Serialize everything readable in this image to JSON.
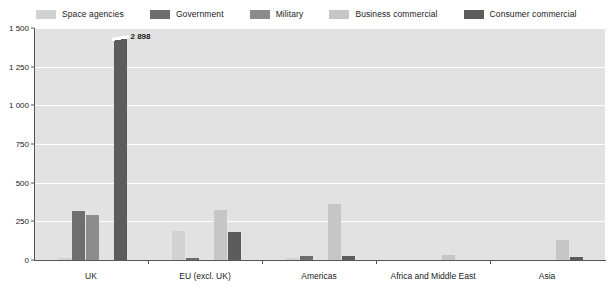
{
  "legend": {
    "position": "top",
    "items": [
      {
        "label": "Space agencies",
        "color": "#d2d2d2"
      },
      {
        "label": "Government",
        "color": "#6e6e6e"
      },
      {
        "label": "Military",
        "color": "#8c8c8c"
      },
      {
        "label": "Business commercial",
        "color": "#c6c6c6"
      },
      {
        "label": "Consumer commercial",
        "color": "#5c5c5c"
      }
    ]
  },
  "yaxis": {
    "ticks": [
      "1 500",
      "1 250",
      "1 000",
      "750",
      "500",
      "250",
      "0"
    ]
  },
  "annotations": {
    "uk_consumer_value_label": "2 898"
  },
  "chart_data": {
    "type": "bar",
    "title": "",
    "subtitle": "",
    "xlabel": "",
    "ylabel": "",
    "ylim": [
      0,
      1500
    ],
    "ytick_values": [
      0,
      250,
      500,
      750,
      1000,
      1250,
      1500
    ],
    "ytick_labels": [
      "0",
      "250",
      "500",
      "750",
      "1 000",
      "1 250",
      "1 500"
    ],
    "grid": true,
    "legend_position": "top",
    "categories": [
      "UK",
      "EU (excl. UK)",
      "Americas",
      "Africa and Middle East",
      "Asia"
    ],
    "series": [
      {
        "name": "Space agencies",
        "color": "#d2d2d2",
        "values": [
          12,
          185,
          10,
          0,
          0
        ]
      },
      {
        "name": "Government",
        "color": "#6e6e6e",
        "values": [
          320,
          13,
          25,
          0,
          0
        ]
      },
      {
        "name": "Military",
        "color": "#8c8c8c",
        "values": [
          290,
          0,
          0,
          0,
          0
        ]
      },
      {
        "name": "Business commercial",
        "color": "#c6c6c6",
        "values": [
          0,
          322,
          362,
          30,
          130
        ]
      },
      {
        "name": "Consumer commercial",
        "color": "#5c5c5c",
        "values": [
          2898,
          180,
          28,
          0,
          18
        ]
      }
    ],
    "truncated_bars": [
      {
        "category": "UK",
        "series": "Consumer commercial",
        "value": 2898,
        "label": "2 898"
      }
    ]
  }
}
